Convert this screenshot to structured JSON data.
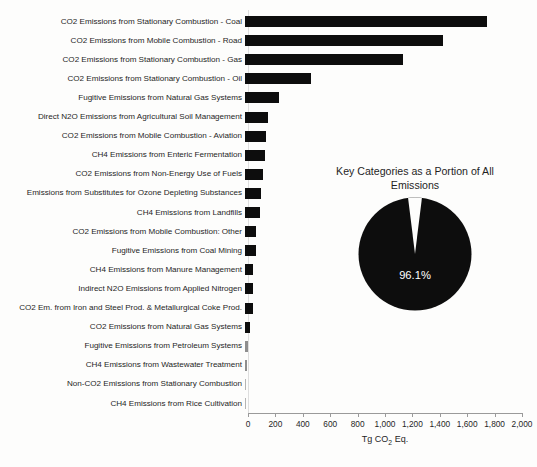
{
  "chart_data": {
    "type": "bar",
    "title": "",
    "xlabel": "Tg CO2 Eq.",
    "ylabel": "",
    "xlim": [
      0,
      2000
    ],
    "grid": false,
    "orientation": "horizontal",
    "categories": [
      "CO2 Emissions from Stationary Combustion - Coal",
      "CO2 Emissions from Mobile Combustion - Road",
      "CO2 Emissions from Stationary Combustion - Gas",
      "CO2 Emissions from Stationary Combustion - Oil",
      "Fugitive Emissions from Natural Gas Systems",
      "Direct N2O Emissions from Agricultural Soil Management",
      "CO2 Emissions from Mobile Combustion - Aviation",
      "CH4 Emissions from Enteric Fermentation",
      "CO2 Emissions from Non-Energy Use of Fuels",
      "Emissions from Substitutes for Ozone Depleting Substances",
      "CH4 Emissions from Landfills",
      "CO2 Emissions from Mobile Combustion: Other",
      "Fugitive Emissions from Coal Mining",
      "CH4 Emissions from Manure Management",
      "Indirect N2O Emissions from Applied Nitrogen",
      "CO2 Em. from Iron and Steel Prod. & Metallurgical Coke Prod.",
      "CO2 Emissions from Natural Gas Systems",
      "Fugitive Emissions from Petroleum Systems",
      "CH4 Emissions from Wastewater Treatment",
      "Non-CO2 Emissions from Stationary Combustion",
      "CH4 Emissions from Rice Cultivation"
    ],
    "values": [
      1766,
      1444,
      1152,
      482,
      248,
      170,
      155,
      148,
      128,
      120,
      108,
      82,
      78,
      62,
      58,
      55,
      38,
      24,
      17,
      9,
      6
    ],
    "xticks": [
      0,
      200,
      400,
      600,
      800,
      1000,
      1200,
      1400,
      1600,
      1800,
      2000
    ],
    "xtick_labels": [
      "0",
      "200",
      "400",
      "600",
      "800",
      "1,000",
      "1,200",
      "1,400",
      "1,600",
      "1,800",
      "2,000"
    ]
  },
  "pie_chart": {
    "type": "pie",
    "title": "Key Categories as a Portion of All Emissions",
    "labels": [
      "Key Categories",
      "Other"
    ],
    "values": [
      96.1,
      3.9
    ],
    "value_label": "96.1%",
    "colors": [
      "#0d0d0d",
      "#fdfdfc"
    ]
  },
  "axis": {
    "unit_label_prefix": "Tg CO",
    "unit_label_sub": "2",
    "unit_label_suffix": " Eq."
  },
  "footnote": ""
}
